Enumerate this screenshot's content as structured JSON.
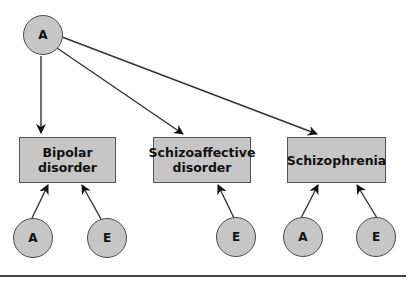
{
  "diagram": {
    "top_node": {
      "label": "A"
    },
    "disorders": [
      {
        "label": "Bipolar\ndisorder",
        "line1": "Bipolar",
        "line2": "disorder"
      },
      {
        "label": "Schizoaffective\ndisorder",
        "line1": "Schizoaffective",
        "line2": "disorder"
      },
      {
        "label": "Schizophrenia",
        "line1": "Schizophrenia",
        "line2": ""
      }
    ],
    "bottom_nodes": [
      {
        "label": "A",
        "target": "Bipolar disorder"
      },
      {
        "label": "E",
        "target": "Bipolar disorder"
      },
      {
        "label": "E",
        "target": "Schizoaffective disorder"
      },
      {
        "label": "A",
        "target": "Schizophrenia"
      },
      {
        "label": "E",
        "target": "Schizophrenia"
      }
    ],
    "edges": [
      {
        "from": "A (top)",
        "to": "Bipolar disorder"
      },
      {
        "from": "A (top)",
        "to": "Schizoaffective disorder"
      },
      {
        "from": "A (top)",
        "to": "Schizophrenia"
      },
      {
        "from": "A",
        "to": "Bipolar disorder"
      },
      {
        "from": "E",
        "to": "Bipolar disorder"
      },
      {
        "from": "E",
        "to": "Schizoaffective disorder"
      },
      {
        "from": "A",
        "to": "Schizophrenia"
      },
      {
        "from": "E",
        "to": "Schizophrenia"
      }
    ],
    "colors": {
      "node_fill": "#c6c6c6",
      "stroke": "#333333"
    }
  }
}
